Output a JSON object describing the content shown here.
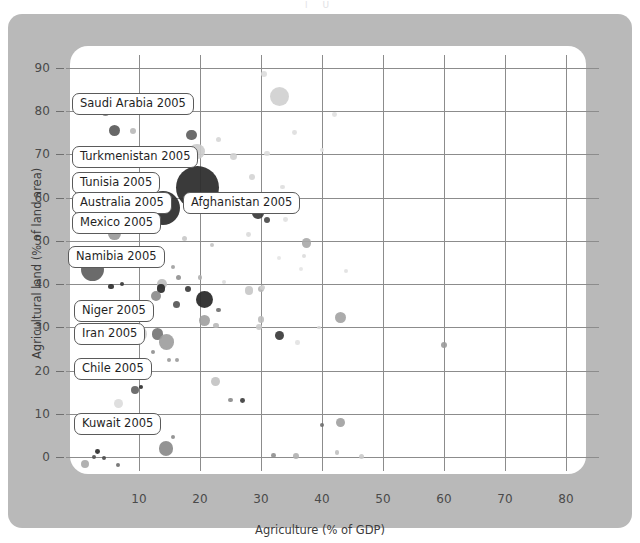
{
  "page": {
    "top_remnant": "l                                        U"
  },
  "chart_data": {
    "type": "scatter",
    "title": "",
    "xlabel": "Agriculture (% of GDP)",
    "ylabel": "Agricultural land (% of land area)",
    "xlim": [
      -2,
      86
    ],
    "ylim": [
      -4,
      94
    ],
    "xticks": [
      10,
      20,
      30,
      40,
      50,
      60,
      70,
      80
    ],
    "yticks": [
      0,
      10,
      20,
      30,
      40,
      50,
      60,
      70,
      80,
      90
    ],
    "grid": true,
    "legend": "none",
    "size_encoding": "bubble area",
    "annotations": [
      {
        "label": "Saudi Arabia 2005",
        "x": 3.0,
        "y": 80.8
      },
      {
        "label": "Turkmenistan 2005",
        "x": 3.2,
        "y": 69.4
      },
      {
        "label": "Tunisia 2005",
        "x": 3.4,
        "y": 63.5
      },
      {
        "label": "Australia 2005",
        "x": 3.6,
        "y": 58.5
      },
      {
        "label": "Mexico 2005",
        "x": 3.8,
        "y": 54.6
      },
      {
        "label": "Afghanistan 2005",
        "x": 19.5,
        "y": 58.0
      },
      {
        "label": "Namibia 2005",
        "x": 2.6,
        "y": 47.0
      },
      {
        "label": "Niger 2005",
        "x": 4.0,
        "y": 36.4
      },
      {
        "label": "Iran 2005",
        "x": 4.2,
        "y": 31.0
      },
      {
        "label": "Chile 2005",
        "x": 4.4,
        "y": 23.2
      },
      {
        "label": "Kuwait 2005",
        "x": 4.6,
        "y": 10.4
      }
    ],
    "points": [
      {
        "x": 2.6,
        "y": 80.9,
        "r": 7.0,
        "c": "#3f3f3f",
        "o": 0.92
      },
      {
        "x": 4.5,
        "y": 79.9,
        "r": 4.4,
        "c": "#7d7d7d",
        "o": 0.9
      },
      {
        "x": 33.0,
        "y": 83.5,
        "r": 9.5,
        "c": "#d0d0d0",
        "o": 0.92
      },
      {
        "x": 30.5,
        "y": 88.6,
        "r": 3.0,
        "c": "#dcdcdc",
        "o": 0.9
      },
      {
        "x": 42.0,
        "y": 79.2,
        "r": 2.4,
        "c": "#e0e0e0",
        "o": 0.9
      },
      {
        "x": 6.0,
        "y": 75.6,
        "r": 5.6,
        "c": "#5a5a5a",
        "o": 0.92
      },
      {
        "x": 9.0,
        "y": 75.4,
        "r": 3.0,
        "c": "#b8b8b8",
        "o": 0.9
      },
      {
        "x": 18.6,
        "y": 74.5,
        "r": 5.4,
        "c": "#5f5f5f",
        "o": 0.92
      },
      {
        "x": 23.0,
        "y": 73.5,
        "r": 2.8,
        "c": "#d6d6d6",
        "o": 0.9
      },
      {
        "x": 35.5,
        "y": 75.0,
        "r": 2.4,
        "c": "#dedede",
        "o": 0.9
      },
      {
        "x": 2.7,
        "y": 69.6,
        "r": 5.4,
        "c": "#4a4a4a",
        "o": 0.92
      },
      {
        "x": 13.5,
        "y": 70.0,
        "r": 4.6,
        "c": "#c8c8c8",
        "o": 0.9
      },
      {
        "x": 19.5,
        "y": 70.6,
        "r": 7.6,
        "c": "#cccccc",
        "o": 0.92
      },
      {
        "x": 25.5,
        "y": 69.5,
        "r": 3.4,
        "c": "#d2d2d2",
        "o": 0.9
      },
      {
        "x": 31.0,
        "y": 70.2,
        "r": 2.8,
        "c": "#dcdcdc",
        "o": 0.9
      },
      {
        "x": 40.0,
        "y": 71.0,
        "r": 2.2,
        "c": "#e2e2e2",
        "o": 0.9
      },
      {
        "x": 17.8,
        "y": 68.1,
        "r": 2.0,
        "c": "#3c3c3c",
        "o": 0.92
      },
      {
        "x": 19.6,
        "y": 62.4,
        "r": 21.5,
        "c": "#2e2e2e",
        "o": 0.94
      },
      {
        "x": 14.0,
        "y": 57.5,
        "r": 17.0,
        "c": "#303030",
        "o": 0.94
      },
      {
        "x": 28.5,
        "y": 64.8,
        "r": 3.0,
        "c": "#d4d4d4",
        "o": 0.9
      },
      {
        "x": 33.5,
        "y": 62.5,
        "r": 2.2,
        "c": "#dedede",
        "o": 0.9
      },
      {
        "x": 29.5,
        "y": 56.5,
        "r": 5.8,
        "c": "#3a3a3a",
        "o": 0.92
      },
      {
        "x": 31.0,
        "y": 54.8,
        "r": 3.0,
        "c": "#4a4a4a",
        "o": 0.92
      },
      {
        "x": 34.0,
        "y": 55.0,
        "r": 2.4,
        "c": "#e0e0e0",
        "o": 0.9
      },
      {
        "x": 26.0,
        "y": 57.8,
        "r": 2.4,
        "c": "#dcdcdc",
        "o": 0.9
      },
      {
        "x": 6.0,
        "y": 51.8,
        "r": 6.4,
        "c": "#9a9a9a",
        "o": 0.92
      },
      {
        "x": 17.5,
        "y": 50.5,
        "r": 2.6,
        "c": "#c8c8c8",
        "o": 0.9
      },
      {
        "x": 22.0,
        "y": 49.0,
        "r": 2.0,
        "c": "#c2c2c2",
        "o": 0.9
      },
      {
        "x": 28.0,
        "y": 51.5,
        "r": 2.4,
        "c": "#dadada",
        "o": 0.9
      },
      {
        "x": 37.5,
        "y": 49.5,
        "r": 4.6,
        "c": "#a8a8a8",
        "o": 0.9
      },
      {
        "x": 2.3,
        "y": 43.4,
        "r": 11.5,
        "c": "#606060",
        "o": 0.93
      },
      {
        "x": 7.0,
        "y": 44.2,
        "r": 2.2,
        "c": "#3f3f3f",
        "o": 0.92
      },
      {
        "x": 9.5,
        "y": 44.5,
        "r": 3.8,
        "c": "#c4c4c4",
        "o": 0.9
      },
      {
        "x": 12.5,
        "y": 45.5,
        "r": 2.6,
        "c": "#b4b4b4",
        "o": 0.9
      },
      {
        "x": 15.6,
        "y": 44.0,
        "r": 2.0,
        "c": "#9e9e9e",
        "o": 0.9
      },
      {
        "x": 16.5,
        "y": 41.6,
        "r": 2.6,
        "c": "#8f8f8f",
        "o": 0.9
      },
      {
        "x": 20.0,
        "y": 41.5,
        "r": 2.4,
        "c": "#b0b0b0",
        "o": 0.9
      },
      {
        "x": 24.0,
        "y": 40.6,
        "r": 2.0,
        "c": "#dcdcdc",
        "o": 0.9
      },
      {
        "x": 5.4,
        "y": 39.4,
        "r": 2.6,
        "c": "#2f2f2f",
        "o": 0.93
      },
      {
        "x": 7.2,
        "y": 40.0,
        "r": 2.0,
        "c": "#3a3a3a",
        "o": 0.92
      },
      {
        "x": 13.8,
        "y": 40.0,
        "r": 4.8,
        "c": "#bcbcbc",
        "o": 0.9
      },
      {
        "x": 13.6,
        "y": 39.0,
        "r": 4.2,
        "c": "#2b2b2b",
        "o": 0.93
      },
      {
        "x": 12.8,
        "y": 37.2,
        "r": 5.0,
        "c": "#8a8a8a",
        "o": 0.9
      },
      {
        "x": 18.0,
        "y": 38.8,
        "r": 3.2,
        "c": "#3c3c3c",
        "o": 0.92
      },
      {
        "x": 20.8,
        "y": 36.4,
        "r": 8.6,
        "c": "#2b2b2b",
        "o": 0.94
      },
      {
        "x": 10.5,
        "y": 35.4,
        "r": 2.6,
        "c": "#7c7c7c",
        "o": 0.9
      },
      {
        "x": 16.2,
        "y": 35.2,
        "r": 3.6,
        "c": "#565656",
        "o": 0.92
      },
      {
        "x": 23.0,
        "y": 34.0,
        "r": 2.4,
        "c": "#6e6e6e",
        "o": 0.9
      },
      {
        "x": 28.0,
        "y": 38.5,
        "r": 4.2,
        "c": "#c6c6c6",
        "o": 0.9
      },
      {
        "x": 30.0,
        "y": 38.8,
        "r": 3.2,
        "c": "#b6b6b6",
        "o": 0.9
      },
      {
        "x": 30.2,
        "y": 39.3,
        "r": 2.6,
        "c": "#cfcfcf",
        "o": 0.9
      },
      {
        "x": 20.7,
        "y": 31.5,
        "r": 5.4,
        "c": "#9f9f9f",
        "o": 0.9
      },
      {
        "x": 22.6,
        "y": 30.4,
        "r": 2.8,
        "c": "#b8b8b8",
        "o": 0.9
      },
      {
        "x": 30.0,
        "y": 31.8,
        "r": 3.4,
        "c": "#bdbdbd",
        "o": 0.9
      },
      {
        "x": 29.6,
        "y": 30.0,
        "r": 3.0,
        "c": "#cacaca",
        "o": 0.9
      },
      {
        "x": 33.0,
        "y": 28.2,
        "r": 4.6,
        "c": "#3a3a3a",
        "o": 0.92
      },
      {
        "x": 43.0,
        "y": 32.3,
        "r": 5.8,
        "c": "#a2a2a2",
        "o": 0.9
      },
      {
        "x": 60.0,
        "y": 25.8,
        "r": 3.0,
        "c": "#9a9a9a",
        "o": 0.9
      },
      {
        "x": 4.0,
        "y": 29.0,
        "r": 2.0,
        "c": "#6a6a6a",
        "o": 0.9
      },
      {
        "x": 10.0,
        "y": 28.5,
        "r": 7.8,
        "c": "#cfcfcf",
        "o": 0.9
      },
      {
        "x": 13.0,
        "y": 28.4,
        "r": 5.8,
        "c": "#757575",
        "o": 0.92
      },
      {
        "x": 14.5,
        "y": 26.6,
        "r": 7.6,
        "c": "#9c9c9c",
        "o": 0.9
      },
      {
        "x": 12.3,
        "y": 24.4,
        "r": 2.0,
        "c": "#8e8e8e",
        "o": 0.9
      },
      {
        "x": 14.9,
        "y": 22.5,
        "r": 2.0,
        "c": "#9a9a9a",
        "o": 0.9
      },
      {
        "x": 16.3,
        "y": 22.4,
        "r": 2.0,
        "c": "#9a9a9a",
        "o": 0.9
      },
      {
        "x": 7.0,
        "y": 20.6,
        "r": 3.6,
        "c": "#585858",
        "o": 0.92
      },
      {
        "x": 6.2,
        "y": 19.6,
        "r": 4.0,
        "c": "#9e9e9e",
        "o": 0.9
      },
      {
        "x": 3.0,
        "y": 18.4,
        "r": 2.2,
        "c": "#6a6a6a",
        "o": 0.9
      },
      {
        "x": 9.8,
        "y": 19.6,
        "r": 3.6,
        "c": "#bdbdbd",
        "o": 0.9
      },
      {
        "x": 22.5,
        "y": 17.4,
        "r": 4.4,
        "c": "#c2c2c2",
        "o": 0.9
      },
      {
        "x": 9.4,
        "y": 15.6,
        "r": 4.0,
        "c": "#636363",
        "o": 0.92
      },
      {
        "x": 10.3,
        "y": 16.2,
        "r": 2.0,
        "c": "#2f2f2f",
        "o": 0.92
      },
      {
        "x": 25.0,
        "y": 13.2,
        "r": 2.2,
        "c": "#8a8a8a",
        "o": 0.9
      },
      {
        "x": 27.0,
        "y": 13.0,
        "r": 2.4,
        "c": "#3e3e3e",
        "o": 0.92
      },
      {
        "x": 6.6,
        "y": 12.4,
        "r": 4.4,
        "c": "#dcdcdc",
        "o": 0.9
      },
      {
        "x": 43.0,
        "y": 8.0,
        "r": 4.4,
        "c": "#a0a0a0",
        "o": 0.9
      },
      {
        "x": 40.0,
        "y": 7.4,
        "r": 2.0,
        "c": "#6e6e6e",
        "o": 0.9
      },
      {
        "x": 14.4,
        "y": 2.0,
        "r": 7.2,
        "c": "#8a8a8a",
        "o": 0.92
      },
      {
        "x": 15.5,
        "y": 4.6,
        "r": 2.0,
        "c": "#8a8a8a",
        "o": 0.9
      },
      {
        "x": 3.2,
        "y": 1.2,
        "r": 2.4,
        "c": "#2e2e2e",
        "o": 0.93
      },
      {
        "x": 2.6,
        "y": 0.0,
        "r": 2.2,
        "c": "#555555",
        "o": 0.92
      },
      {
        "x": 4.2,
        "y": -0.2,
        "r": 2.0,
        "c": "#4c4c4c",
        "o": 0.92
      },
      {
        "x": 1.2,
        "y": -1.6,
        "r": 4.0,
        "c": "#a9a9a9",
        "o": 0.9
      },
      {
        "x": 6.6,
        "y": -1.8,
        "r": 2.0,
        "c": "#6c6c6c",
        "o": 0.9
      },
      {
        "x": 32.0,
        "y": 0.4,
        "r": 2.4,
        "c": "#8e8e8e",
        "o": 0.9
      },
      {
        "x": 35.8,
        "y": 0.2,
        "r": 3.0,
        "c": "#b0b0b0",
        "o": 0.9
      },
      {
        "x": 42.5,
        "y": 1.0,
        "r": 2.2,
        "c": "#c0c0c0",
        "o": 0.9
      },
      {
        "x": 46.5,
        "y": 0.2,
        "r": 2.6,
        "c": "#cacaca",
        "o": 0.9
      },
      {
        "x": 39.5,
        "y": 30.0,
        "r": 1.8,
        "c": "#d6d6d6",
        "o": 0.9
      },
      {
        "x": 44.0,
        "y": 43.0,
        "r": 2.0,
        "c": "#e0e0e0",
        "o": 0.9
      },
      {
        "x": 37.0,
        "y": 46.5,
        "r": 2.2,
        "c": "#dcdcdc",
        "o": 0.9
      },
      {
        "x": 36.0,
        "y": 26.5,
        "r": 2.2,
        "c": "#e2e2e2",
        "o": 0.9
      },
      {
        "x": 36.5,
        "y": 43.6,
        "r": 2.0,
        "c": "#e4e4e4",
        "o": 0.9
      },
      {
        "x": 33.0,
        "y": 46.0,
        "r": 2.0,
        "c": "#e4e4e4",
        "o": 0.9
      }
    ]
  }
}
